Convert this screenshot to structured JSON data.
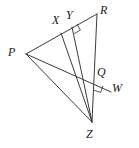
{
  "figure": {
    "stroke_color": "#3c3c3c",
    "label_color": "#1a1a1a",
    "background_color": "#ffffff",
    "width": 139,
    "height": 148,
    "points": {
      "P": {
        "label": "P",
        "x": 26,
        "y": 54
      },
      "R": {
        "label": "R",
        "x": 97,
        "y": 14
      },
      "X": {
        "label": "X",
        "x": 61,
        "y": 33
      },
      "Y": {
        "label": "Y",
        "x": 72,
        "y": 27
      },
      "Q": {
        "label": "Q",
        "x": 96,
        "y": 82
      },
      "W": {
        "label": "W",
        "x": 111,
        "y": 92
      },
      "Z": {
        "label": "Z",
        "x": 92,
        "y": 122
      }
    },
    "segments": [
      {
        "name": "segment-PR",
        "from": "P",
        "to": "R"
      },
      {
        "name": "segment-RZ",
        "from": "R",
        "to": "Z"
      },
      {
        "name": "segment-PZ",
        "from": "P",
        "to": "Z"
      },
      {
        "name": "segment-ZX",
        "from": "Z",
        "to": "X"
      },
      {
        "name": "segment-ZY",
        "from": "Z",
        "to": "Y"
      },
      {
        "name": "segment-PW",
        "from": "P",
        "to": "W"
      }
    ],
    "right_angles": [
      {
        "name": "right-angle-at-Y",
        "vertex": "Y"
      },
      {
        "name": "right-angle-at-Q",
        "vertex": "Q"
      }
    ],
    "labels": [
      {
        "name": "vertex-label-P",
        "text": "P",
        "left": 8,
        "top": 46
      },
      {
        "name": "vertex-label-X",
        "text": "X",
        "left": 52,
        "top": 14
      },
      {
        "name": "vertex-label-Y",
        "text": "Y",
        "left": 66,
        "top": 9
      },
      {
        "name": "vertex-label-R",
        "text": "R",
        "left": 100,
        "top": 4
      },
      {
        "name": "vertex-label-Q",
        "text": "Q",
        "left": 97,
        "top": 66
      },
      {
        "name": "vertex-label-W",
        "text": "W",
        "left": 112,
        "top": 82
      },
      {
        "name": "vertex-label-Z",
        "text": "Z",
        "left": 86,
        "top": 128
      }
    ]
  }
}
